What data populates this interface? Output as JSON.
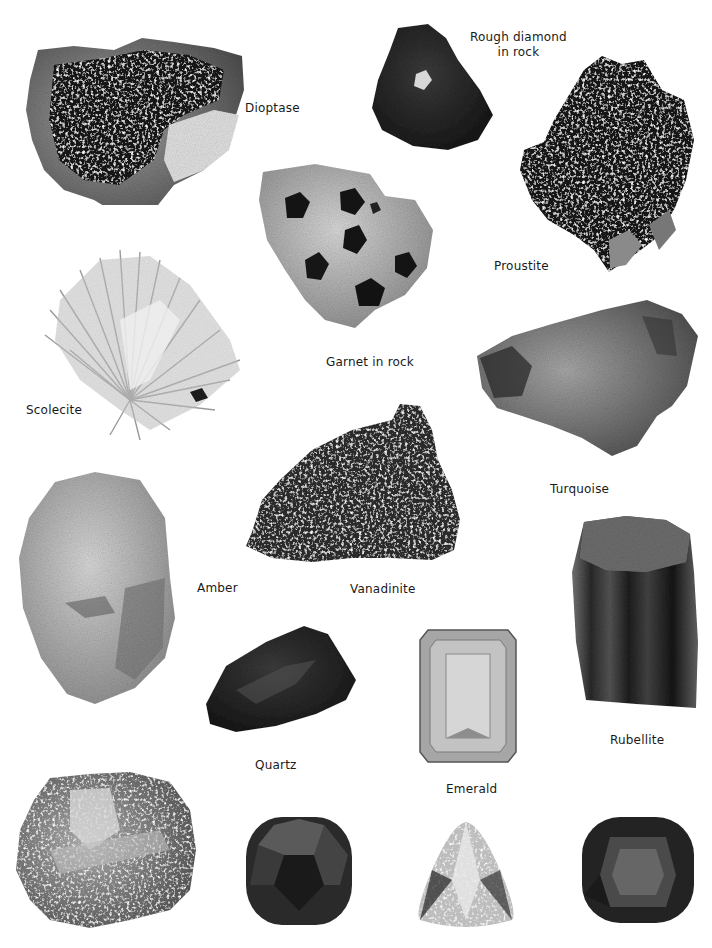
{
  "page": {
    "type": "mineral-and-gemstone-identification-plate",
    "background": "#ffffff"
  },
  "specimens": [
    {
      "id": "dioptase",
      "label": "Dioptase",
      "form": "crystal-cluster-on-matrix"
    },
    {
      "id": "rough-diamond",
      "label": "Rough diamond\nin rock",
      "form": "rough-in-matrix"
    },
    {
      "id": "proustite",
      "label": "Proustite",
      "form": "crystal-cluster"
    },
    {
      "id": "garnet",
      "label": "Garnet in rock",
      "form": "crystals-in-matrix"
    },
    {
      "id": "scolecite",
      "label": "Scolecite",
      "form": "radiating-needles"
    },
    {
      "id": "turquoise",
      "label": "Turquoise",
      "form": "rough-nodule"
    },
    {
      "id": "vanadinite",
      "label": "Vanadinite",
      "form": "crystal-cluster"
    },
    {
      "id": "amber",
      "label": "Amber",
      "form": "rough-piece"
    },
    {
      "id": "rubellite",
      "label": "Rubellite",
      "form": "striated-crystal"
    },
    {
      "id": "quartz",
      "label": "Quartz",
      "form": "rough-piece"
    },
    {
      "id": "emerald",
      "label": "Emerald",
      "form": "emerald-cut-gem"
    },
    {
      "id": "unlabeled-mineral",
      "label": "",
      "form": "metallic-rough"
    },
    {
      "id": "cushion-gem-1",
      "label": "",
      "form": "cushion-cut-gem"
    },
    {
      "id": "trillion-gem",
      "label": "",
      "form": "trillion-cut-gem"
    },
    {
      "id": "cushion-gem-2",
      "label": "",
      "form": "cushion-cut-gem"
    }
  ],
  "labels": {
    "dioptase": "Dioptase",
    "rough_diamond": "Rough diamond\nin rock",
    "proustite": "Proustite",
    "garnet": "Garnet in rock",
    "scolecite": "Scolecite",
    "turquoise": "Turquoise",
    "vanadinite": "Vanadinite",
    "amber": "Amber",
    "rubellite": "Rubellite",
    "quartz": "Quartz",
    "emerald": "Emerald"
  }
}
